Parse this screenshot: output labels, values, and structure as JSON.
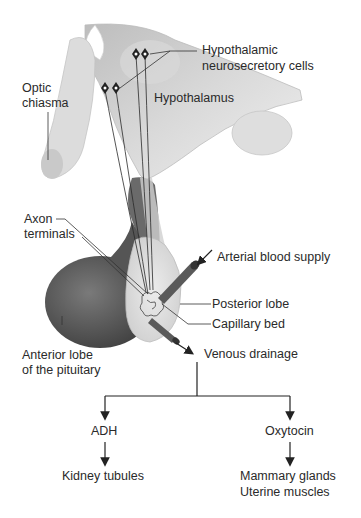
{
  "diagram": {
    "labels": {
      "hypothalamic_cells_1": "Hypothalamic",
      "hypothalamic_cells_2": "neurosecretory cells",
      "optic_chiasma_1": "Optic",
      "optic_chiasma_2": "chiasma",
      "hypothalamus": "Hypothalamus",
      "axon_terminals_1": "Axon",
      "axon_terminals_2": "terminals",
      "arterial": "Arterial blood supply",
      "posterior_lobe": "Posterior lobe",
      "capillary_bed": "Capillary bed",
      "anterior_lobe_1": "Anterior lobe",
      "anterior_lobe_2": "of the pituitary",
      "venous": "Venous drainage"
    },
    "flow": {
      "branches": [
        {
          "hormone": "ADH",
          "targets": [
            "Kidney tubules"
          ]
        },
        {
          "hormone": "Oxytocin",
          "targets": [
            "Mammary glands",
            "Uterine muscles"
          ]
        }
      ]
    },
    "colors": {
      "tissue_light": "#e6e6e6",
      "tissue_mid": "#c4c4c4",
      "anterior_lobe": "#5a5a5a",
      "vessel": "#555555",
      "line": "#222222",
      "text": "#2a2a2a"
    }
  }
}
